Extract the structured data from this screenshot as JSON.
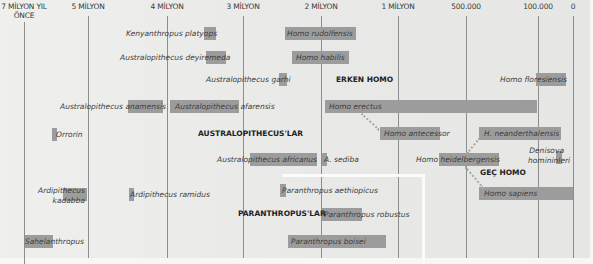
{
  "diagram": {
    "axis": {
      "ticks": [
        {
          "label": "7 MİLYON YIL",
          "label2": "ÖNCE",
          "x": 24
        },
        {
          "label": "5 MİLYON",
          "x": 88
        },
        {
          "label": "4 MİLYON",
          "x": 167
        },
        {
          "label": "3 MİLYON",
          "x": 243
        },
        {
          "label": "2 MİLYON",
          "x": 321
        },
        {
          "label": "1 MİLYON",
          "x": 398
        },
        {
          "label": "500.000",
          "x": 466
        },
        {
          "label": "100.000",
          "x": 538
        },
        {
          "label": "0",
          "x": 573
        }
      ]
    },
    "groups": {
      "early_homo": "ERKEN HOMO",
      "australopithecines": "AUSTRALOPITHECUS'LAR",
      "late_homo": "GEÇ HOMO",
      "paranthropines": "PARANTHROPUS'LAR"
    },
    "species": [
      {
        "name": "Kenyanthropus platyops"
      },
      {
        "name": "Homo rudolfensis"
      },
      {
        "name": "Australopithecus deyiremeda"
      },
      {
        "name": "Homo habilis"
      },
      {
        "name": "Australopithecus garhi"
      },
      {
        "name": "Homo floresiensis"
      },
      {
        "name": "Australopithecus anamensis"
      },
      {
        "name": "Australopithecus afarensis"
      },
      {
        "name": "Homo erectus"
      },
      {
        "name": "Orrorin"
      },
      {
        "name": "Homo antecessor"
      },
      {
        "name": "H. neanderthalensis"
      },
      {
        "name": "Australopithecus africanus"
      },
      {
        "name": "A. sediba"
      },
      {
        "name": "Homo heidelbergensis"
      },
      {
        "name": "Denisova",
        "name2": "homininleri"
      },
      {
        "name": "Ardipithecus",
        "name2": "kadabba"
      },
      {
        "name": "Ardipithecus ramidus"
      },
      {
        "name": "Paranthropus aethiopicus"
      },
      {
        "name": "Homo sapiens"
      },
      {
        "name": "Paranthropus robustus"
      },
      {
        "name": "Sahelanthropus"
      },
      {
        "name": "Paranthropus boisei"
      }
    ]
  }
}
